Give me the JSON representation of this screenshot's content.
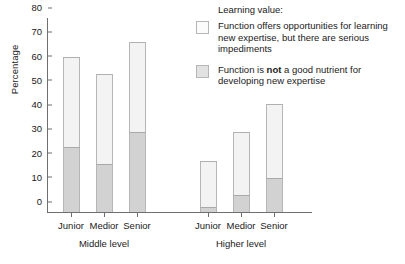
{
  "chart_data": {
    "type": "bar",
    "title": "",
    "xlabel": "",
    "ylabel": "Percentage",
    "ylim": [
      0,
      80
    ],
    "yticks": [
      "0",
      "10",
      "20",
      "30",
      "40",
      "50",
      "60",
      "70",
      "80"
    ],
    "grid": false,
    "stacked": true,
    "legend_position": "top-right",
    "legend_title": "Learning value:",
    "groups": [
      {
        "name": "Middle level",
        "categories": [
          "Junior",
          "Medior",
          "Senior"
        ]
      },
      {
        "name": "Higher level",
        "categories": [
          "Junior",
          "Medior",
          "Senior"
        ]
      }
    ],
    "categories": [
      "Middle level Junior",
      "Middle level Medior",
      "Middle level Senior",
      "Higher level Junior",
      "Higher level Medior",
      "Higher level Senior"
    ],
    "series": [
      {
        "name": "Function is not a good nutrient for developing new expertise",
        "color": "#d2d2d2",
        "values": [
          27,
          20,
          33,
          2,
          7,
          14
        ]
      },
      {
        "name": "Function offers opportunities for learning new expertise, but there are serious impediments",
        "color": "#f3f3f3",
        "values": [
          37,
          37,
          37,
          19,
          26,
          30.5
        ]
      }
    ],
    "totals": [
      64,
      57,
      70,
      21,
      33,
      44.5
    ]
  },
  "legend": {
    "title": "Learning value:",
    "items": [
      {
        "swatch": "light",
        "text": "Function offers opportunities for learning new expertise, but there are serious impediments"
      },
      {
        "swatch": "dark",
        "text_before": "Function is ",
        "emphasis": "not",
        "text_after": " a good nutrient for developing new expertise"
      }
    ]
  },
  "axes": {
    "y_title": "Percentage",
    "y_ticks": [
      "80",
      "70",
      "60",
      "50",
      "40",
      "30",
      "20",
      "10",
      "0"
    ]
  },
  "x_labels": {
    "middle": [
      "Junior",
      "Medior",
      "Senior"
    ],
    "higher": [
      "Junior",
      "Medior",
      "Senior"
    ],
    "groups": [
      "Middle level",
      "Higher level"
    ]
  }
}
